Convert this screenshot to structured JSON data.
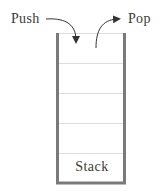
{
  "diagram": {
    "type": "stack",
    "labels": {
      "push": "Push",
      "pop": "Pop",
      "stack": "Stack"
    },
    "slots": 5,
    "colors": {
      "wall": "#7a7a7a",
      "divider": "#dcdcdc",
      "arrow": "#333333",
      "text": "#3a3a3a"
    }
  }
}
